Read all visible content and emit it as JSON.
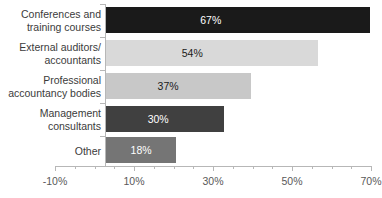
{
  "chart_data": {
    "type": "bar",
    "orientation": "horizontal",
    "title": "",
    "xlabel": "",
    "ylabel": "",
    "categories": [
      "Conferences and training courses",
      "External auditors/ accountants",
      "Professional accountancy bodies",
      "Management consultants",
      "Other"
    ],
    "category_lines": [
      [
        "Conferences and",
        "training courses"
      ],
      [
        "External auditors/",
        "accountants"
      ],
      [
        "Professional",
        "accountancy bodies"
      ],
      [
        "Management",
        "consultants"
      ],
      [
        "Other"
      ]
    ],
    "values": [
      67,
      54,
      37,
      30,
      18
    ],
    "data_labels": [
      "67%",
      "54%",
      "37%",
      "30%",
      "18%"
    ],
    "bar_colors": [
      "#1a1a1a",
      "#d9d9d9",
      "#c8c8c8",
      "#404040",
      "#757575"
    ],
    "data_label_colors": [
      "#ffffff",
      "#1a1a1a",
      "#1a1a1a",
      "#ffffff",
      "#ffffff"
    ],
    "xlim": [
      -10,
      70
    ],
    "xticks": [
      -10,
      10,
      30,
      50,
      70
    ],
    "xtick_labels": [
      "-10%",
      "10%",
      "30%",
      "50%",
      "70%"
    ],
    "xtick_minor_step": 5,
    "grid": false,
    "legend": null
  },
  "axis": {
    "line_color": "#b7b7b7",
    "tick_label_color": "#595959",
    "category_label_color": "#3b3b3b"
  }
}
